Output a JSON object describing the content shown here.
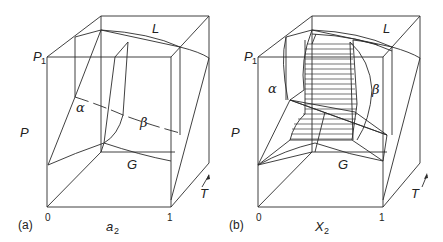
{
  "figure": {
    "panels": [
      {
        "id": "a",
        "panel_label": "(a)",
        "x_axis_label": "a",
        "x_axis_subscript": "2",
        "x_tick_min": "0",
        "x_tick_max": "1",
        "y_axis_label": "P",
        "y_marker_label": "P",
        "y_marker_subscript": "1",
        "depth_axis_label": "T",
        "phase_labels": {
          "liquid": "L",
          "gas": "G",
          "alpha": "α",
          "beta": "β"
        }
      },
      {
        "id": "b",
        "panel_label": "(b)",
        "x_axis_label": "X",
        "x_axis_subscript": "2",
        "x_tick_min": "0",
        "x_tick_max": "1",
        "y_axis_label": "P",
        "y_marker_label": "P",
        "y_marker_subscript": "1",
        "depth_axis_label": "T",
        "phase_labels": {
          "liquid": "L",
          "gas": "G",
          "alpha": "α",
          "beta": "β"
        }
      }
    ],
    "colors": {
      "line": "#2b2b2b",
      "background": "#ffffff"
    }
  }
}
